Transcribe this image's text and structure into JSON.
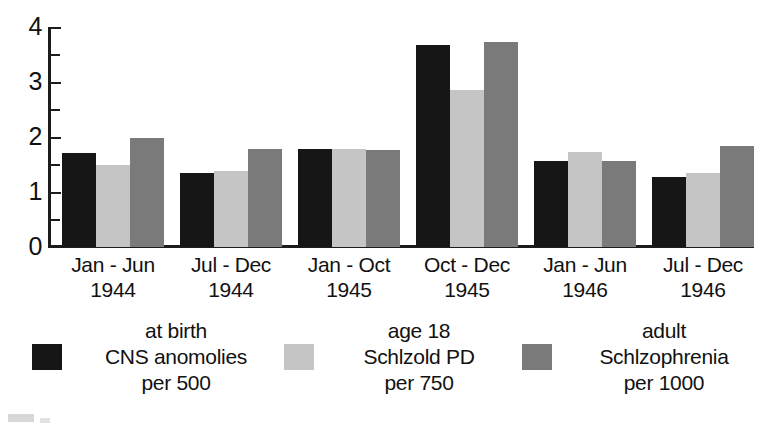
{
  "chart_data": {
    "type": "bar",
    "title": "",
    "xlabel": "",
    "ylabel": "",
    "ylim": [
      0,
      4
    ],
    "yticks": [
      "0",
      "1",
      "2",
      "3",
      "4"
    ],
    "ytick_values": [
      0,
      1,
      2,
      3,
      4
    ],
    "minor_ticks": [
      0.5,
      1.5,
      2.5,
      3.5
    ],
    "grid": false,
    "legend_position": "bottom",
    "categories": [
      "Jan - Jun 1944",
      "Jul - Dec 1944",
      "Jan - Oct 1945",
      "Oct - Dec 1945",
      "Jan - Jun 1946",
      "Jul - Dec 1946"
    ],
    "category_lines": [
      {
        "range": "Jan - Jun",
        "year": "1944"
      },
      {
        "range": "Jul - Dec",
        "year": "1944"
      },
      {
        "range": "Jan - Oct",
        "year": "1945"
      },
      {
        "range": "Oct - Dec",
        "year": "1945"
      },
      {
        "range": "Jan - Jun",
        "year": "1946"
      },
      {
        "range": "Jul - Dec",
        "year": "1946"
      }
    ],
    "series": [
      {
        "name": "at birth CNS anomolies per 500",
        "color": "#161616",
        "values": [
          1.7,
          1.35,
          1.79,
          3.67,
          1.57,
          1.27
        ]
      },
      {
        "name": "age 18 Schlzold PD per 750",
        "color": "#c5c5c5",
        "values": [
          1.49,
          1.39,
          1.79,
          2.86,
          1.72,
          1.35
        ]
      },
      {
        "name": "adult Schlzophrenia per 1000",
        "color": "#7a7a7a",
        "values": [
          1.98,
          1.79,
          1.77,
          3.72,
          1.56,
          1.84
        ]
      }
    ],
    "legend": [
      {
        "swatch": "#161616",
        "line1": "at birth",
        "line2": "CNS anomolies",
        "line3": "per 500"
      },
      {
        "swatch": "#c5c5c5",
        "line1": "age 18",
        "line2": "Schlzold PD",
        "line3": "per 750"
      },
      {
        "swatch": "#7a7a7a",
        "line1": "adult",
        "line2": "Schlzophrenia",
        "line3": "per 1000"
      }
    ]
  },
  "colors": {
    "series_black": "#161616",
    "series_light_gray": "#c5c5c5",
    "series_dark_gray": "#7a7a7a",
    "axis": "#1c1c1c",
    "background": "#ffffff"
  }
}
